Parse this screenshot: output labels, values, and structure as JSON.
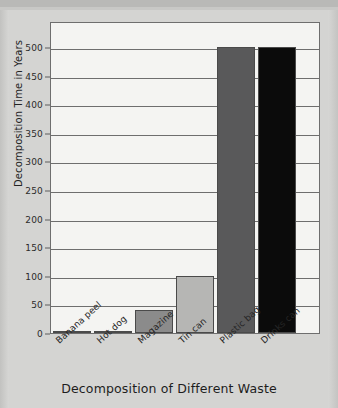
{
  "chart_data": {
    "type": "bar",
    "title": "",
    "xlabel": "Decomposition of Different Waste",
    "ylabel": "Decomposition Time in Years",
    "categories": [
      "Banana peel",
      "Hot dog",
      "Magazine",
      "Tin can",
      "Plastic bag",
      "Drinks can"
    ],
    "values": [
      2,
      3,
      40,
      100,
      500,
      500
    ],
    "ylim": [
      0,
      500
    ],
    "ytick_labels": [
      "0",
      "50",
      "100",
      "150",
      "200",
      "250",
      "300",
      "350",
      "400",
      "450",
      "500"
    ],
    "ytick_values": [
      0,
      50,
      100,
      150,
      200,
      250,
      300,
      350,
      400,
      450,
      500
    ],
    "grid": true,
    "legend": "none",
    "bar_colors": [
      "#d9d9d7",
      "#171717",
      "#8b8b8b",
      "#b6b6b4",
      "#59595a",
      "#0b0b0b"
    ]
  },
  "colors": {
    "page_background": "#d4d4d2",
    "plot_background": "#f4f4f2",
    "axis": "#6e6e6e",
    "text": "#222222"
  }
}
